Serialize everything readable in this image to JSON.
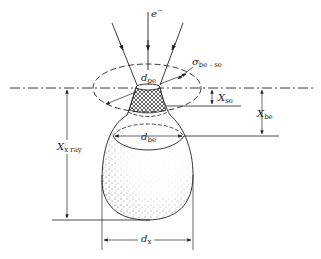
{
  "diagram": {
    "type": "electron-beam interaction volume schematic",
    "labels": {
      "electron": {
        "main": "e",
        "sup": "−"
      },
      "d_pe": {
        "main": "d",
        "sub": "pe"
      },
      "sigma_be_se": {
        "main": "σ",
        "sub": "be - se"
      },
      "x_se": {
        "main": "X",
        "sub": "se"
      },
      "x_be": {
        "main": "X",
        "sub": "be"
      },
      "d_be": {
        "main": "d",
        "sub": "be"
      },
      "x_xray": {
        "main": "X",
        "sub": "x ray"
      },
      "d_x": {
        "main": "d",
        "sub": "x"
      }
    },
    "colors": {
      "line": "#222222",
      "background": "#ffffff",
      "stipple": "#333333"
    }
  }
}
